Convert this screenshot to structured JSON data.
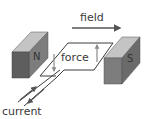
{
  "diagram": {
    "labels": {
      "field": "field",
      "force": "force",
      "current": "current",
      "north_pole": "N",
      "south_pole": "S"
    },
    "colors": {
      "magnet_front": "#7d7d7d",
      "magnet_top": "#c4c4c4",
      "magnet_side": "#5e5e5e",
      "wire": "#3c3c3c",
      "arrow": "#555555",
      "force_arrow": "#8a8a8a",
      "text": "#3a3a3a"
    },
    "elements": [
      {
        "id": "magnet-north",
        "label": "N",
        "position": "left"
      },
      {
        "id": "magnet-south",
        "label": "S",
        "position": "right"
      },
      {
        "id": "wire-loop",
        "shape": "rectangular loop between poles"
      },
      {
        "id": "field-arrow",
        "direction": "left-to-right (N to S)"
      },
      {
        "id": "force-arrow-left",
        "direction": "down"
      },
      {
        "id": "force-arrow-right",
        "direction": "up"
      },
      {
        "id": "current-arrows",
        "direction": "in and out along leads"
      }
    ]
  }
}
